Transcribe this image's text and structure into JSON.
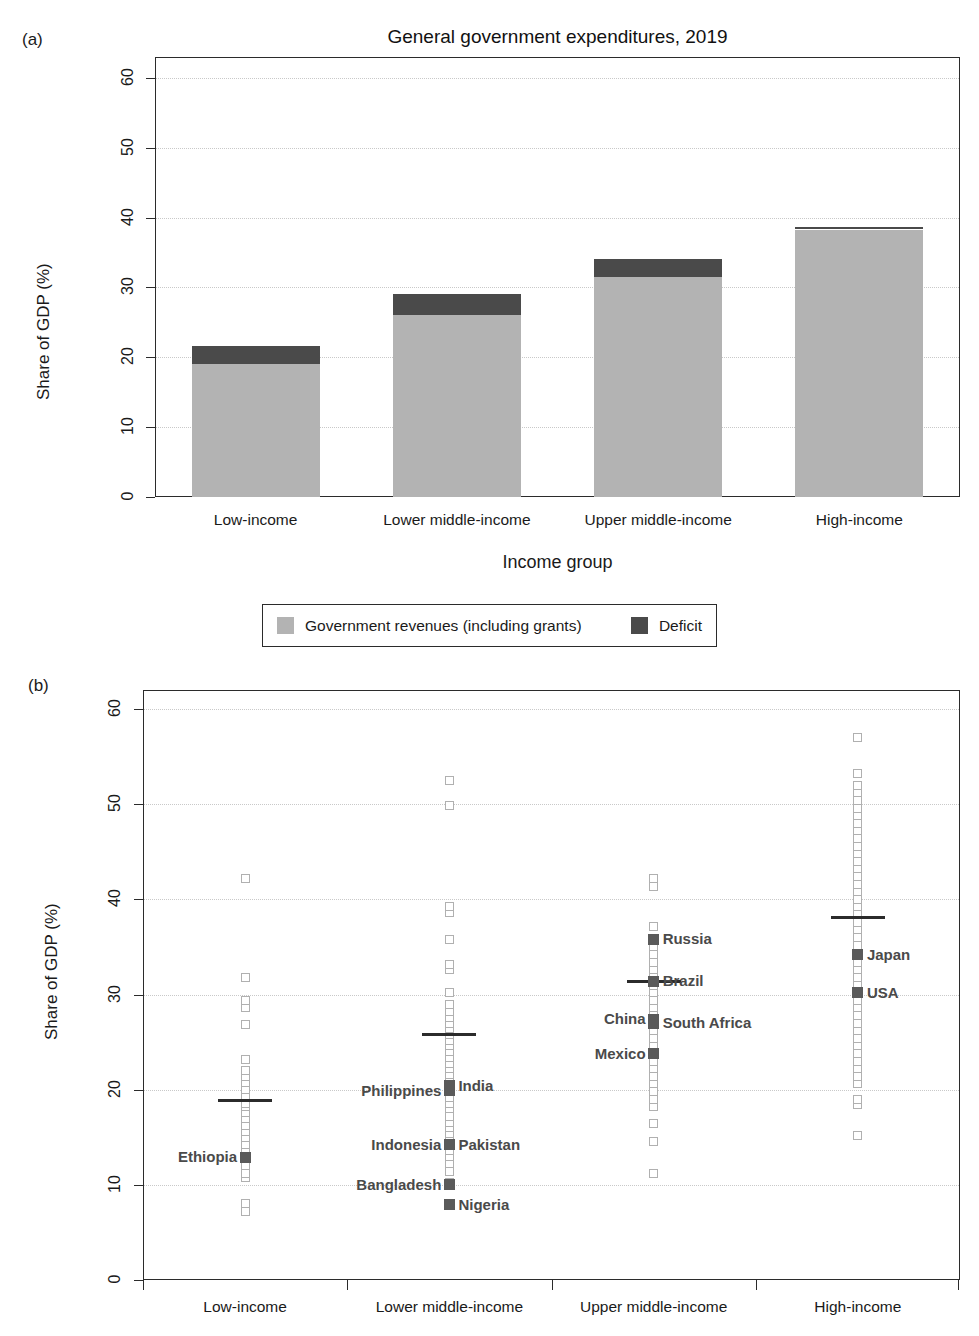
{
  "figure": {
    "panel_a_tag": "(a)",
    "panel_b_tag": "(b)"
  },
  "chart_data": [
    {
      "type": "bar",
      "panel": "(a)",
      "title": "General government expenditures, 2019",
      "xlabel": "Income group",
      "ylabel": "Share of GDP (%)",
      "ylim": [
        0,
        63
      ],
      "yticks": [
        0,
        10,
        20,
        30,
        40,
        50,
        60
      ],
      "grid": true,
      "stacked": true,
      "categories": [
        "Low-income",
        "Lower middle-income",
        "Upper middle-income",
        "High-income"
      ],
      "series": [
        {
          "name": "Government revenues (including grants)",
          "color": "#b3b3b3",
          "values": [
            19.0,
            26.0,
            31.5,
            38.3
          ]
        },
        {
          "name": "Deficit",
          "color": "#4a4a4a",
          "values": [
            2.6,
            3.1,
            2.6,
            0.4
          ]
        }
      ],
      "totals": [
        21.6,
        29.1,
        34.1,
        38.7
      ],
      "legend_position": "bottom"
    },
    {
      "type": "scatter",
      "panel": "(b)",
      "title": "",
      "xlabel": "",
      "ylabel": "Share of GDP (%)",
      "ylim": [
        0,
        62
      ],
      "yticks": [
        0,
        10,
        20,
        30,
        40,
        50,
        60
      ],
      "grid": true,
      "categories": [
        "Low-income",
        "Lower middle-income",
        "Upper middle-income",
        "High-income"
      ],
      "group_means": [
        19.0,
        26.0,
        31.5,
        38.3
      ],
      "groups": [
        {
          "name": "Low-income",
          "values": [
            7.2,
            8.0,
            10.8,
            11.2,
            12.0,
            12.8,
            13.4,
            14.2,
            15.0,
            15.6,
            16.2,
            17.0,
            17.6,
            18.2,
            18.6,
            19.2,
            20.0,
            20.8,
            21.4,
            22.0,
            23.2,
            26.8,
            28.6,
            29.4,
            31.8,
            42.2
          ],
          "highlighted": [
            {
              "label": "Ethiopia",
              "value": 12.9,
              "side": "left"
            }
          ]
        },
        {
          "name": "Lower middle-income",
          "values": [
            8.0,
            9.9,
            10.2,
            11.4,
            12.2,
            13.0,
            13.6,
            14.2,
            14.8,
            15.4,
            16.0,
            16.6,
            17.2,
            18.0,
            18.6,
            19.2,
            19.8,
            20.4,
            21.0,
            21.6,
            22.2,
            22.8,
            23.4,
            24.0,
            24.6,
            25.2,
            25.8,
            26.4,
            27.0,
            27.6,
            28.2,
            29.0,
            30.2,
            32.6,
            33.2,
            35.8,
            38.6,
            39.3,
            49.9,
            52.5
          ],
          "highlighted": [
            {
              "label": "Nigeria",
              "value": 7.9,
              "side": "right"
            },
            {
              "label": "Bangladesh",
              "value": 10.0,
              "side": "left"
            },
            {
              "label": "Indonesia",
              "value": 14.2,
              "side": "left"
            },
            {
              "label": "Pakistan",
              "value": 14.2,
              "side": "right"
            },
            {
              "label": "Philippines",
              "value": 19.9,
              "side": "left"
            },
            {
              "label": "India",
              "value": 20.4,
              "side": "right"
            }
          ]
        },
        {
          "name": "Upper middle-income",
          "values": [
            11.2,
            14.6,
            16.4,
            18.2,
            19.0,
            19.8,
            20.6,
            21.4,
            22.2,
            23.0,
            23.8,
            24.6,
            25.4,
            26.2,
            27.0,
            27.8,
            28.6,
            29.4,
            30.2,
            31.0,
            31.8,
            32.6,
            33.4,
            34.2,
            35.0,
            37.2,
            41.4,
            42.2
          ],
          "highlighted": [
            {
              "label": "Mexico",
              "value": 23.8,
              "side": "left"
            },
            {
              "label": "China",
              "value": 27.4,
              "side": "left"
            },
            {
              "label": "South Africa",
              "value": 27.0,
              "side": "right"
            },
            {
              "label": "Brazil",
              "value": 31.4,
              "side": "right"
            },
            {
              "label": "Russia",
              "value": 35.8,
              "side": "right"
            }
          ]
        },
        {
          "name": "High-income",
          "values": [
            15.2,
            18.4,
            19.0,
            20.6,
            21.4,
            22.2,
            23.0,
            23.8,
            24.6,
            25.4,
            26.2,
            27.0,
            27.8,
            28.6,
            29.4,
            31.0,
            31.8,
            32.6,
            33.4,
            35.2,
            36.0,
            36.8,
            37.6,
            38.4,
            39.2,
            40.0,
            40.8,
            41.6,
            42.4,
            43.2,
            44.0,
            44.8,
            45.6,
            46.4,
            47.2,
            48.0,
            48.8,
            49.6,
            50.4,
            51.2,
            52.0,
            53.2,
            57.0
          ],
          "highlighted": [
            {
              "label": "USA",
              "value": 30.2,
              "side": "right"
            },
            {
              "label": "Japan",
              "value": 34.2,
              "side": "right"
            }
          ]
        }
      ]
    }
  ],
  "colors": {
    "revenue": "#b3b3b3",
    "deficit": "#4a4a4a",
    "axis": "#2b2b2b",
    "grid": "#c9c9c9",
    "highlight": "#5a5a5a"
  }
}
